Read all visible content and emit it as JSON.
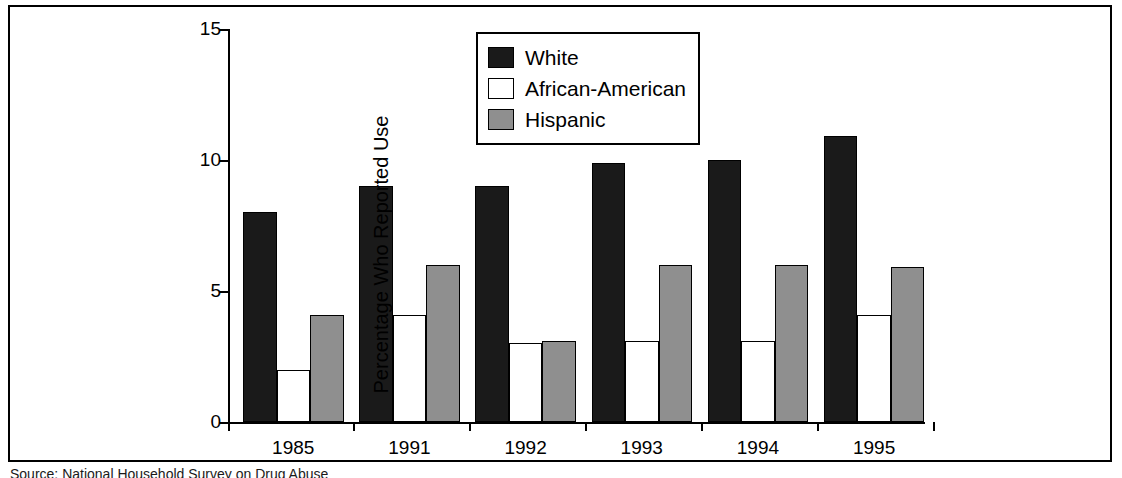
{
  "chart_data": {
    "type": "bar",
    "title": "",
    "subtitle": "",
    "xlabel": "",
    "ylabel": "Percentage Who Reported Use",
    "categories": [
      "1985",
      "1991",
      "1992",
      "1993",
      "1994",
      "1995"
    ],
    "series": [
      {
        "name": "White",
        "color": "#1a1a1a",
        "values": [
          8.0,
          9.0,
          9.0,
          9.9,
          10.0,
          10.9
        ]
      },
      {
        "name": "African-American",
        "color": "#ffffff",
        "values": [
          2.0,
          4.1,
          3.0,
          3.1,
          3.1,
          4.1
        ]
      },
      {
        "name": "Hispanic",
        "color": "#8f8f8f",
        "values": [
          4.1,
          6.0,
          3.1,
          6.0,
          6.0,
          5.9
        ]
      }
    ],
    "ylim": [
      0,
      15
    ],
    "yticks": [
      0,
      5,
      10,
      15
    ],
    "ytick_labels": [
      "0",
      "5",
      "10",
      "15"
    ],
    "grid": false,
    "legend_position": "top-center"
  },
  "legend": {
    "entries": [
      {
        "label": "White"
      },
      {
        "label": "African-American"
      },
      {
        "label": "Hispanic"
      }
    ]
  },
  "axes": {
    "y_title": "Percentage Who Reported Use",
    "y_tick_labels": [
      "15",
      "10",
      "5",
      "0"
    ],
    "x_tick_labels": [
      "1985",
      "1991",
      "1992",
      "1993",
      "1994",
      "1995"
    ]
  },
  "footer": {
    "source_note": "Source: National Household Survey on Drug Abuse"
  }
}
